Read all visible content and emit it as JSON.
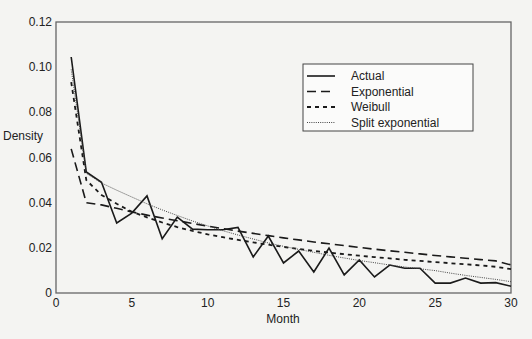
{
  "chart_data": {
    "type": "line",
    "title": "",
    "xlabel": "Month",
    "ylabel": "Density",
    "xlim": [
      0,
      30
    ],
    "ylim": [
      0,
      0.12
    ],
    "xticks": [
      0,
      5,
      10,
      15,
      20,
      25,
      30
    ],
    "xtick_labels": [
      "0",
      "5",
      "10",
      "15",
      "20",
      "25",
      "30"
    ],
    "yticks": [
      0,
      0.02,
      0.04,
      0.06,
      0.08,
      0.1,
      0.12
    ],
    "ytick_labels": [
      "0",
      "0.02",
      "0.04",
      "0.06",
      "0.08",
      "0.10",
      "0.12"
    ],
    "grid": false,
    "legend_position": "top-right",
    "x": [
      1,
      2,
      3,
      4,
      5,
      6,
      7,
      8,
      9,
      10,
      11,
      12,
      13,
      14,
      15,
      16,
      17,
      18,
      19,
      20,
      21,
      22,
      23,
      24,
      25,
      26,
      27,
      28,
      29,
      30
    ],
    "series": [
      {
        "name": "Actual",
        "style": "solid",
        "values": [
          0.1045,
          0.0536,
          0.049,
          0.031,
          0.0354,
          0.043,
          0.024,
          0.0336,
          0.0283,
          0.028,
          0.028,
          0.029,
          0.016,
          0.0252,
          0.0133,
          0.0186,
          0.0093,
          0.0199,
          0.008,
          0.0146,
          0.0071,
          0.0124,
          0.011,
          0.011,
          0.0044,
          0.0044,
          0.0066,
          0.0044,
          0.0046,
          0.003
        ]
      },
      {
        "name": "Exponential",
        "style": "dashed",
        "values": [
          0.0638,
          0.04,
          0.039,
          0.0375,
          0.0359,
          0.0345,
          0.0332,
          0.032,
          0.0308,
          0.0296,
          0.0285,
          0.0274,
          0.0264,
          0.0254,
          0.0244,
          0.0235,
          0.0226,
          0.0218,
          0.021,
          0.0202,
          0.0194,
          0.0187,
          0.018,
          0.0173,
          0.0166,
          0.016,
          0.0154,
          0.0148,
          0.0142,
          0.0124
        ]
      },
      {
        "name": "Weibull",
        "style": "dotted-dash",
        "values": [
          0.0934,
          0.05,
          0.0434,
          0.0395,
          0.036,
          0.0335,
          0.0312,
          0.0292,
          0.0275,
          0.026,
          0.0247,
          0.0235,
          0.0224,
          0.0214,
          0.0204,
          0.0195,
          0.0187,
          0.0179,
          0.0172,
          0.0165,
          0.0159,
          0.0153,
          0.0147,
          0.0142,
          0.0137,
          0.0132,
          0.0127,
          0.0122,
          0.0116,
          0.0106
        ]
      },
      {
        "name": "Split exponential",
        "style": "fine-dotted",
        "values": [
          0.099,
          0.053,
          0.0487,
          0.0455,
          0.0425,
          0.0395,
          0.0368,
          0.0343,
          0.0319,
          0.0297,
          0.0276,
          0.0257,
          0.0239,
          0.0222,
          0.0207,
          0.0193,
          0.018,
          0.0167,
          0.0155,
          0.0144,
          0.0134,
          0.0124,
          0.0115,
          0.0107,
          0.0099,
          0.0088,
          0.0078,
          0.0069,
          0.006,
          0.005
        ]
      }
    ]
  }
}
